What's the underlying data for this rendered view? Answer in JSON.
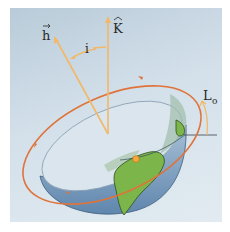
{
  "diagram": {
    "type": "orbital-geometry",
    "labels": {
      "h_vector": "h",
      "k_unit": "K",
      "inclination": "i",
      "longitude": "L",
      "longitude_sub": "o"
    },
    "colors": {
      "background": "#c8d8e4",
      "orbit": "#e0733a",
      "vector": "#f2b868",
      "ocean": "#7f9fc0",
      "land": "#7cb64a",
      "interior": "#d6e2ea",
      "node_marker": "#f6a93a",
      "reference_line": "#4a5560"
    }
  }
}
